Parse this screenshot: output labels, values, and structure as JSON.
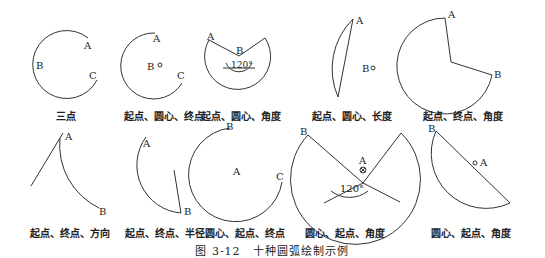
{
  "figure_caption": "图 3-12　十种圆弧绘制示例",
  "panels": [
    {
      "caption": "三点",
      "labels": [
        "A",
        "B",
        "C"
      ]
    },
    {
      "caption": "起点、圆心、终点",
      "labels": [
        "A",
        "B",
        "C"
      ]
    },
    {
      "caption": "起点、圆心、角度",
      "labels": [
        "A",
        "B"
      ],
      "angle": "120°"
    },
    {
      "caption": "起点、圆心、长度",
      "labels": [
        "A",
        "B"
      ]
    },
    {
      "caption": "起点、终点、角度",
      "labels": [
        "A",
        "B"
      ]
    },
    {
      "caption": "起点、终点、方向",
      "labels": [
        "A",
        "B"
      ]
    },
    {
      "caption": "起点、终点、半径",
      "labels": [
        "A",
        "B"
      ]
    },
    {
      "caption": "圆心、起点、终点",
      "labels": [
        "A",
        "B",
        "C"
      ]
    },
    {
      "caption": "圆心、起点、角度",
      "labels": [
        "A",
        "B"
      ],
      "angle": "120°"
    },
    {
      "caption": "圆心、起点、角度",
      "labels": [
        "A",
        "B"
      ]
    }
  ],
  "colors": {
    "stroke": "#333333",
    "text": "#222222"
  }
}
